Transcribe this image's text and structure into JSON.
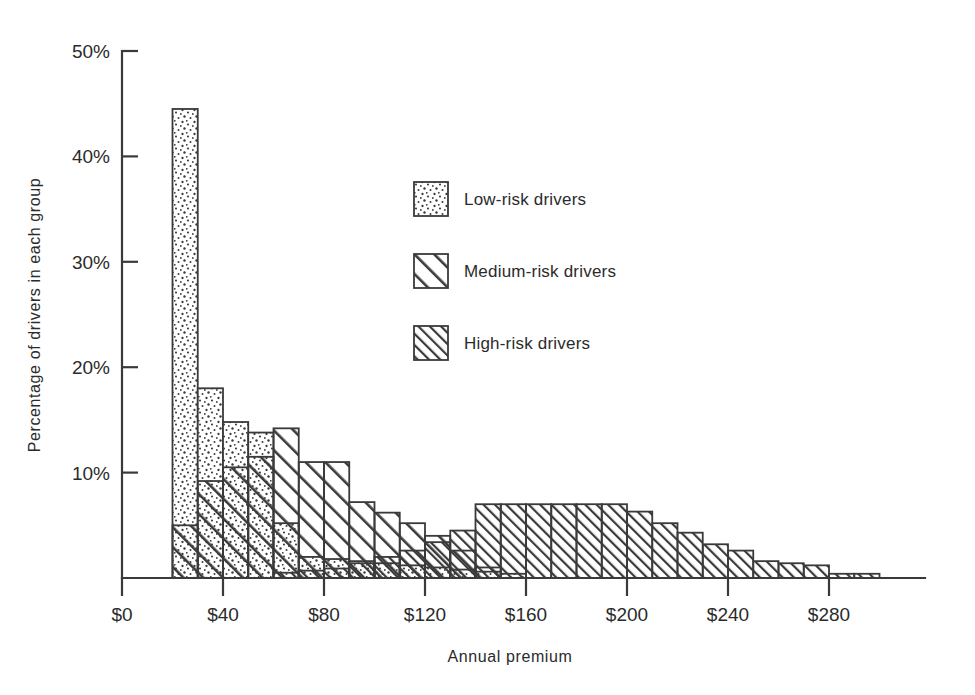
{
  "chart_data": {
    "type": "bar",
    "title": "",
    "subtitle": "",
    "xlabel": "Annual premium",
    "ylabel": "Percentage of drivers in each group",
    "xlim": [
      0,
      320
    ],
    "ylim": [
      0,
      50
    ],
    "xtick_labels": [
      "$0",
      "$40",
      "$80",
      "$120",
      "$160",
      "$200",
      "$240",
      "$280"
    ],
    "xtick_values": [
      0,
      40,
      80,
      120,
      160,
      200,
      240,
      280
    ],
    "ytick_labels": [
      "10%",
      "20%",
      "30%",
      "40%",
      "50%"
    ],
    "ytick_values": [
      10,
      20,
      30,
      40,
      50
    ],
    "grid": false,
    "legend_position": "upper-center",
    "bin_width": 10,
    "series": [
      {
        "name": "Low-risk drivers",
        "pattern": "dots",
        "bin_starts": [
          20,
          30,
          40,
          50,
          60,
          70,
          80,
          90,
          100,
          110,
          120,
          130,
          140,
          150
        ],
        "values": [
          44.5,
          18.0,
          14.8,
          13.8,
          5.2,
          2.0,
          1.8,
          1.6,
          1.4,
          1.2,
          1.0,
          0.8,
          0.6,
          0.4
        ]
      },
      {
        "name": "Medium-risk drivers",
        "pattern": "wide-hatch",
        "bin_starts": [
          20,
          30,
          40,
          50,
          60,
          70,
          80,
          90,
          100,
          110,
          120,
          130,
          140
        ],
        "values": [
          5.0,
          9.2,
          10.5,
          11.5,
          14.2,
          11.0,
          11.0,
          7.2,
          6.2,
          5.2,
          4.0,
          2.6,
          1.0
        ]
      },
      {
        "name": "High-risk drivers",
        "pattern": "tight-hatch",
        "bin_starts": [
          60,
          70,
          80,
          90,
          100,
          110,
          120,
          130,
          140,
          150,
          160,
          170,
          180,
          190,
          200,
          210,
          220,
          230,
          240,
          250,
          260,
          270,
          280,
          290
        ],
        "values": [
          0.5,
          0.7,
          0.9,
          1.4,
          2.0,
          2.6,
          3.4,
          4.5,
          7.0,
          7.0,
          7.0,
          7.0,
          7.0,
          7.0,
          6.3,
          5.2,
          4.3,
          3.2,
          2.6,
          1.6,
          1.4,
          1.2,
          0.4,
          0.4
        ]
      }
    ]
  },
  "legend": {
    "items": [
      {
        "label": "Low-risk drivers",
        "pattern": "dots"
      },
      {
        "label": "Medium-risk drivers",
        "pattern": "wide-hatch"
      },
      {
        "label": "High-risk drivers",
        "pattern": "tight-hatch"
      }
    ]
  },
  "axes": {
    "y_title": "Percentage of drivers in each group",
    "x_title": "Annual premium"
  }
}
